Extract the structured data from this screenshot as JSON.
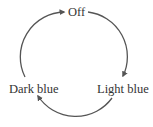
{
  "diagram": {
    "type": "cycle",
    "direction": "clockwise",
    "nodes": [
      {
        "id": "off",
        "label": "Off"
      },
      {
        "id": "light_blue",
        "label": "Light blue"
      },
      {
        "id": "dark_blue",
        "label": "Dark blue"
      }
    ],
    "edges": [
      {
        "from": "off",
        "to": "light_blue"
      },
      {
        "from": "light_blue",
        "to": "dark_blue"
      },
      {
        "from": "dark_blue",
        "to": "off"
      }
    ],
    "colors": {
      "arrow": "#555555",
      "text": "#333333",
      "background": "#ffffff"
    }
  }
}
